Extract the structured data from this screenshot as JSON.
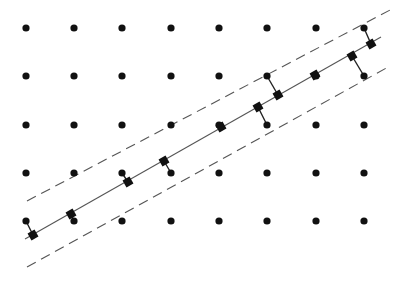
{
  "diagram": {
    "colors": {
      "background": "#ffffff",
      "dot": "#111111",
      "line": "#555555",
      "dash": "#555555",
      "square": "#111111"
    },
    "grid": {
      "xs": [
        26,
        74,
        122,
        171,
        219,
        267,
        316,
        364
      ],
      "ys": [
        28,
        76,
        125,
        173,
        221
      ],
      "dot_radius": 3.6
    },
    "center_line": {
      "x1": 25,
      "y1": 239,
      "x2": 381,
      "y2": 37
    },
    "upper_dashed": {
      "x1": 27,
      "y1": 201,
      "x2": 392,
      "y2": 9
    },
    "lower_dashed": {
      "x1": 27,
      "y1": 267,
      "x2": 390,
      "y2": 66
    },
    "projections": [
      {
        "from": [
          26,
          221
        ],
        "to": [
          33,
          235
        ]
      },
      {
        "from": [
          74,
          221
        ],
        "to": [
          71,
          214
        ]
      },
      {
        "from": [
          122,
          173
        ],
        "to": [
          128,
          182
        ]
      },
      {
        "from": [
          171,
          173
        ],
        "to": [
          164,
          161
        ]
      },
      {
        "from": [
          219,
          125
        ],
        "to": [
          221,
          127
        ]
      },
      {
        "from": [
          267,
          125
        ],
        "to": [
          258,
          107
        ]
      },
      {
        "from": [
          267,
          76
        ],
        "to": [
          278,
          95
        ]
      },
      {
        "from": [
          316,
          76
        ],
        "to": [
          315,
          75
        ]
      },
      {
        "from": [
          364,
          76
        ],
        "to": [
          352,
          56
        ]
      },
      {
        "from": [
          364,
          28
        ],
        "to": [
          371,
          44
        ]
      }
    ],
    "square_size": 8
  }
}
